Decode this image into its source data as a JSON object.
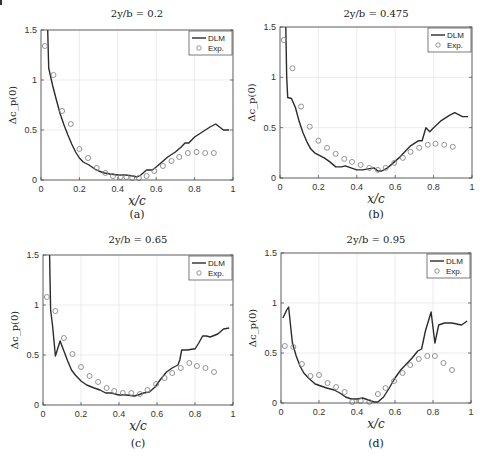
{
  "figure": {
    "corner_mark": true
  },
  "chart_data": [
    {
      "type": "line",
      "panel": "(a)",
      "title": "2y/b = 0.2",
      "xlabel": "x/c",
      "ylabel": "Δc_p(0)",
      "xlim": [
        0,
        1
      ],
      "ylim": [
        0,
        1.5
      ],
      "xticks": [
        "0",
        "0.2",
        "0.4",
        "0.6",
        "0.8",
        "1"
      ],
      "yticks": [
        "0",
        "0.5",
        "1",
        "1.5"
      ],
      "grid": true,
      "legend": {
        "position": "top-right",
        "entries": [
          "DLM",
          "Exp."
        ]
      },
      "series": [
        {
          "name": "DLM",
          "style": "line",
          "x": [
            0.035,
            0.04,
            0.06,
            0.08,
            0.1,
            0.12,
            0.14,
            0.16,
            0.18,
            0.2,
            0.22,
            0.25,
            0.28,
            0.3,
            0.33,
            0.36,
            0.4,
            0.44,
            0.48,
            0.5,
            0.52,
            0.55,
            0.58,
            0.6,
            0.63,
            0.66,
            0.7,
            0.73,
            0.75,
            0.77,
            0.8,
            0.84,
            0.88,
            0.91,
            0.95,
            0.98
          ],
          "y": [
            1.5,
            1.12,
            0.95,
            0.8,
            0.66,
            0.55,
            0.45,
            0.36,
            0.28,
            0.22,
            0.18,
            0.15,
            0.11,
            0.09,
            0.07,
            0.06,
            0.05,
            0.05,
            0.04,
            0.03,
            0.05,
            0.1,
            0.1,
            0.13,
            0.18,
            0.23,
            0.28,
            0.33,
            0.37,
            0.37,
            0.43,
            0.48,
            0.53,
            0.56,
            0.5,
            0.5
          ]
        },
        {
          "name": "Exp.",
          "style": "markers",
          "x": [
            0.02,
            0.065,
            0.11,
            0.155,
            0.2,
            0.245,
            0.29,
            0.335,
            0.375,
            0.415,
            0.445,
            0.475,
            0.51,
            0.55,
            0.59,
            0.635,
            0.68,
            0.72,
            0.765,
            0.81,
            0.855,
            0.9
          ],
          "y": [
            1.34,
            1.05,
            0.69,
            0.56,
            0.31,
            0.22,
            0.12,
            0.07,
            0.04,
            0.03,
            0.03,
            0.02,
            0.02,
            0.04,
            0.09,
            0.14,
            0.19,
            0.23,
            0.27,
            0.28,
            0.27,
            0.27
          ]
        }
      ]
    },
    {
      "type": "line",
      "panel": "(b)",
      "title": "2y/b = 0.475",
      "xlabel": "x/c",
      "ylabel": "Δc_p(0)",
      "xlim": [
        0,
        1
      ],
      "ylim": [
        0,
        1.5
      ],
      "xticks": [
        "0",
        "0.2",
        "0.4",
        "0.6",
        "0.8",
        "1"
      ],
      "yticks": [
        "0",
        "0.5",
        "1",
        "1.5"
      ],
      "grid": true,
      "legend": {
        "position": "top-right",
        "entries": [
          "DLM",
          "Exp."
        ]
      },
      "series": [
        {
          "name": "DLM",
          "style": "line",
          "x": [
            0.03,
            0.035,
            0.04,
            0.06,
            0.08,
            0.1,
            0.12,
            0.14,
            0.16,
            0.18,
            0.2,
            0.23,
            0.26,
            0.29,
            0.32,
            0.34,
            0.37,
            0.4,
            0.43,
            0.46,
            0.49,
            0.51,
            0.53,
            0.56,
            0.59,
            0.62,
            0.65,
            0.68,
            0.72,
            0.74,
            0.76,
            0.78,
            0.8,
            0.84,
            0.88,
            0.91,
            0.95,
            0.98
          ],
          "y": [
            1.5,
            1.0,
            0.8,
            0.79,
            0.7,
            0.56,
            0.45,
            0.36,
            0.29,
            0.25,
            0.23,
            0.2,
            0.16,
            0.11,
            0.11,
            0.12,
            0.1,
            0.08,
            0.08,
            0.09,
            0.1,
            0.07,
            0.07,
            0.1,
            0.15,
            0.2,
            0.26,
            0.32,
            0.37,
            0.37,
            0.5,
            0.46,
            0.5,
            0.57,
            0.62,
            0.65,
            0.61,
            0.61
          ]
        },
        {
          "name": "Exp.",
          "style": "markers",
          "x": [
            0.02,
            0.065,
            0.11,
            0.155,
            0.2,
            0.245,
            0.29,
            0.335,
            0.375,
            0.42,
            0.465,
            0.51,
            0.55,
            0.595,
            0.64,
            0.68,
            0.725,
            0.77,
            0.81,
            0.855,
            0.9
          ],
          "y": [
            1.37,
            1.09,
            0.71,
            0.51,
            0.37,
            0.3,
            0.24,
            0.19,
            0.16,
            0.13,
            0.1,
            0.08,
            0.1,
            0.15,
            0.2,
            0.26,
            0.3,
            0.33,
            0.34,
            0.33,
            0.31
          ]
        }
      ]
    },
    {
      "type": "line",
      "panel": "(c)",
      "title": "2y/b = 0.65",
      "xlabel": "x/c",
      "ylabel": "Δc_p(0)",
      "xlim": [
        0,
        1
      ],
      "ylim": [
        0,
        1.5
      ],
      "xticks": [
        "0",
        "0.2",
        "0.4",
        "0.6",
        "0.8",
        "1"
      ],
      "yticks": [
        "0",
        "0.5",
        "1",
        "1.5"
      ],
      "grid": true,
      "legend": {
        "position": "top-right",
        "entries": [
          "DLM",
          "Exp."
        ]
      },
      "series": [
        {
          "name": "DLM",
          "style": "line",
          "x": [
            0.035,
            0.04,
            0.05,
            0.065,
            0.09,
            0.11,
            0.13,
            0.15,
            0.17,
            0.2,
            0.23,
            0.27,
            0.3,
            0.33,
            0.36,
            0.4,
            0.44,
            0.48,
            0.5,
            0.53,
            0.56,
            0.59,
            0.62,
            0.65,
            0.68,
            0.71,
            0.72,
            0.73,
            0.76,
            0.79,
            0.8,
            0.82,
            0.84,
            0.86,
            0.88,
            0.92,
            0.95,
            0.98
          ],
          "y": [
            1.5,
            0.95,
            0.8,
            0.49,
            0.64,
            0.54,
            0.44,
            0.35,
            0.3,
            0.24,
            0.2,
            0.17,
            0.15,
            0.12,
            0.12,
            0.1,
            0.1,
            0.09,
            0.1,
            0.12,
            0.13,
            0.18,
            0.26,
            0.33,
            0.37,
            0.4,
            0.45,
            0.55,
            0.55,
            0.56,
            0.56,
            0.62,
            0.69,
            0.69,
            0.68,
            0.71,
            0.76,
            0.77
          ]
        },
        {
          "name": "Exp.",
          "style": "markers",
          "x": [
            0.02,
            0.065,
            0.11,
            0.155,
            0.2,
            0.245,
            0.29,
            0.335,
            0.375,
            0.42,
            0.465,
            0.51,
            0.55,
            0.595,
            0.64,
            0.68,
            0.725,
            0.77,
            0.81,
            0.855,
            0.9
          ],
          "y": [
            1.08,
            0.94,
            0.67,
            0.51,
            0.38,
            0.29,
            0.23,
            0.17,
            0.14,
            0.12,
            0.12,
            0.11,
            0.15,
            0.21,
            0.27,
            0.32,
            0.37,
            0.42,
            0.39,
            0.37,
            0.33
          ]
        }
      ]
    },
    {
      "type": "line",
      "panel": "(d)",
      "title": "2y/b = 0.95",
      "xlabel": "x/c",
      "ylabel": "Δc_p(0)",
      "xlim": [
        0,
        1
      ],
      "ylim": [
        0,
        1.5
      ],
      "xticks": [
        "0",
        "0.2",
        "0.4",
        "0.6",
        "0.8",
        "1"
      ],
      "yticks": [
        "0",
        "0.5",
        "1",
        "1.5"
      ],
      "grid": true,
      "legend": {
        "position": "top-right",
        "entries": [
          "DLM",
          "Exp."
        ]
      },
      "series": [
        {
          "name": "DLM",
          "style": "line",
          "x": [
            0.01,
            0.03,
            0.04,
            0.06,
            0.08,
            0.1,
            0.12,
            0.15,
            0.18,
            0.21,
            0.24,
            0.28,
            0.31,
            0.34,
            0.37,
            0.4,
            0.43,
            0.46,
            0.49,
            0.51,
            0.54,
            0.57,
            0.6,
            0.63,
            0.66,
            0.69,
            0.72,
            0.74,
            0.76,
            0.79,
            0.81,
            0.83,
            0.86,
            0.9,
            0.95,
            0.98
          ],
          "y": [
            0.85,
            0.93,
            0.96,
            0.6,
            0.47,
            0.37,
            0.3,
            0.24,
            0.19,
            0.17,
            0.15,
            0.13,
            0.1,
            0.06,
            0.04,
            0.04,
            0.05,
            0.03,
            0.01,
            0.01,
            0.06,
            0.15,
            0.25,
            0.33,
            0.39,
            0.45,
            0.52,
            0.54,
            0.72,
            0.91,
            0.6,
            0.78,
            0.8,
            0.8,
            0.78,
            0.82
          ]
        },
        {
          "name": "Exp.",
          "style": "markers",
          "x": [
            0.02,
            0.065,
            0.11,
            0.155,
            0.2,
            0.245,
            0.29,
            0.335,
            0.375,
            0.42,
            0.465,
            0.51,
            0.55,
            0.595,
            0.64,
            0.68,
            0.725,
            0.77,
            0.81,
            0.855,
            0.9
          ],
          "y": [
            0.57,
            0.56,
            0.39,
            0.27,
            0.28,
            0.2,
            0.16,
            0.11,
            0.01,
            0.02,
            0.01,
            0.09,
            0.15,
            0.22,
            0.3,
            0.38,
            0.44,
            0.47,
            0.47,
            0.4,
            0.33
          ]
        }
      ]
    }
  ],
  "panels": [
    {
      "title": "2y/b = 0.2",
      "caption": "(a)",
      "xlabel": "x/c",
      "ylabel": "Δc_p(0)",
      "legend": [
        "DLM",
        "Exp."
      ]
    },
    {
      "title": "2y/b = 0.475",
      "caption": "(b)",
      "xlabel": "x/c",
      "ylabel": "Δc_p(0)",
      "legend": [
        "DLM",
        "Exp."
      ]
    },
    {
      "title": "2y/b = 0.65",
      "caption": "(c)",
      "xlabel": "x/c",
      "ylabel": "Δc_p(0)",
      "legend": [
        "DLM",
        "Exp."
      ]
    },
    {
      "title": "2y/b = 0.95",
      "caption": "(d)",
      "xlabel": "x/c",
      "ylabel": "Δc_p(0)",
      "legend": [
        "DLM",
        "Exp."
      ]
    }
  ],
  "layout": {
    "frames": [
      {
        "left": 41,
        "right": 233,
        "top": 30,
        "bottom": 180,
        "title_y": 17,
        "caption_y": 218
      },
      {
        "left": 280,
        "right": 472,
        "top": 27,
        "bottom": 178,
        "title_y": 17,
        "caption_y": 218
      },
      {
        "left": 43,
        "right": 233,
        "top": 255,
        "bottom": 405,
        "title_y": 243,
        "caption_y": 447
      },
      {
        "left": 281,
        "right": 471,
        "top": 253,
        "bottom": 403,
        "title_y": 243,
        "caption_y": 447
      }
    ],
    "colors": {
      "line": "#2b2b2b",
      "marker": "#888888",
      "grid": "#e4e4e4",
      "axis": "#444444"
    }
  }
}
